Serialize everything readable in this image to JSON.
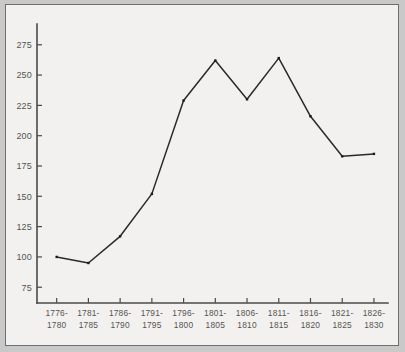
{
  "chart_data": {
    "type": "line",
    "title": "",
    "subtitle": "",
    "xlabel": "",
    "ylabel": "",
    "categories": [
      "1776-\n1780",
      "1781-\n1785",
      "1786-\n1790",
      "1791-\n1795",
      "1796-\n1800",
      "1801-\n1805",
      "1806-\n1810",
      "1811-\n1815",
      "1816-\n1820",
      "1821-\n1825",
      "1826-\n1830"
    ],
    "category_lines": [
      [
        "1776-",
        "1780"
      ],
      [
        "1781-",
        "1785"
      ],
      [
        "1786-",
        "1790"
      ],
      [
        "1791-",
        "1795"
      ],
      [
        "1796-",
        "1800"
      ],
      [
        "1801-",
        "1805"
      ],
      [
        "1806-",
        "1810"
      ],
      [
        "1811-",
        "1815"
      ],
      [
        "1816-",
        "1820"
      ],
      [
        "1821-",
        "1825"
      ],
      [
        "1826-",
        "1830"
      ]
    ],
    "values": [
      100,
      95,
      117,
      152,
      229,
      262,
      230,
      264,
      216,
      183,
      185
    ],
    "ytick_labels": [
      "75",
      "100",
      "125",
      "150",
      "175",
      "200",
      "225",
      "250",
      "275"
    ],
    "yticks": [
      75,
      100,
      125,
      150,
      175,
      200,
      225,
      250,
      275
    ],
    "ylim": [
      62,
      288
    ],
    "grid": false,
    "legend": false,
    "legend_position": "none",
    "markers": "square",
    "line_color": "#2b2a29",
    "marker_color": "#1d1c1b",
    "axis_color": "#4c4a48",
    "background_color": "#f2f1ef",
    "page_color": "#c9c9c9",
    "border_color": "#6e6e6e"
  }
}
